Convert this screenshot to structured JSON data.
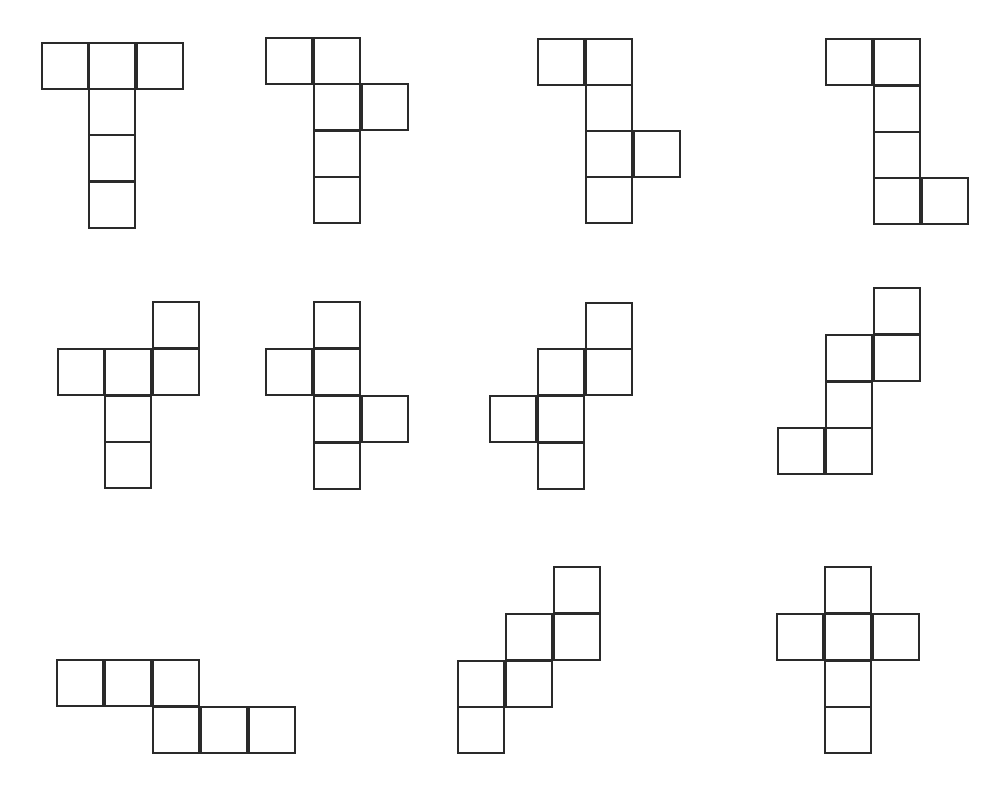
{
  "style": {
    "stroke": "#2a2a2a",
    "fill": "#ffffff",
    "cell_size": 48
  },
  "nets": [
    {
      "id": 1,
      "cells": [
        [
          41,
          42
        ],
        [
          88,
          42
        ],
        [
          136,
          42
        ],
        [
          88,
          88
        ],
        [
          88,
          134
        ],
        [
          88,
          181
        ]
      ]
    },
    {
      "id": 2,
      "cells": [
        [
          265,
          37
        ],
        [
          313,
          37
        ],
        [
          313,
          83
        ],
        [
          361,
          83
        ],
        [
          313,
          130
        ],
        [
          313,
          176
        ]
      ]
    },
    {
      "id": 3,
      "cells": [
        [
          537,
          38
        ],
        [
          585,
          38
        ],
        [
          585,
          84
        ],
        [
          585,
          130
        ],
        [
          633,
          130
        ],
        [
          585,
          176
        ]
      ]
    },
    {
      "id": 4,
      "cells": [
        [
          825,
          38
        ],
        [
          873,
          38
        ],
        [
          873,
          85
        ],
        [
          873,
          131
        ],
        [
          873,
          177
        ],
        [
          921,
          177
        ]
      ]
    },
    {
      "id": 5,
      "cells": [
        [
          152,
          301
        ],
        [
          57,
          348
        ],
        [
          104,
          348
        ],
        [
          152,
          348
        ],
        [
          104,
          395
        ],
        [
          104,
          441
        ]
      ]
    },
    {
      "id": 6,
      "cells": [
        [
          313,
          301
        ],
        [
          265,
          348
        ],
        [
          313,
          348
        ],
        [
          313,
          395
        ],
        [
          361,
          395
        ],
        [
          313,
          442
        ]
      ]
    },
    {
      "id": 7,
      "cells": [
        [
          585,
          302
        ],
        [
          537,
          348
        ],
        [
          585,
          348
        ],
        [
          489,
          395
        ],
        [
          537,
          395
        ],
        [
          537,
          442
        ]
      ]
    },
    {
      "id": 8,
      "cells": [
        [
          873,
          287
        ],
        [
          825,
          334
        ],
        [
          873,
          334
        ],
        [
          825,
          381
        ],
        [
          777,
          427
        ],
        [
          825,
          427
        ]
      ]
    },
    {
      "id": 9,
      "cells": [
        [
          56,
          659
        ],
        [
          104,
          659
        ],
        [
          152,
          659
        ],
        [
          152,
          706
        ],
        [
          200,
          706
        ],
        [
          248,
          706
        ]
      ]
    },
    {
      "id": 10,
      "cells": [
        [
          553,
          566
        ],
        [
          505,
          613
        ],
        [
          553,
          613
        ],
        [
          457,
          660
        ],
        [
          505,
          660
        ],
        [
          457,
          706
        ]
      ]
    },
    {
      "id": 11,
      "cells": [
        [
          824,
          566
        ],
        [
          776,
          613
        ],
        [
          824,
          613
        ],
        [
          872,
          613
        ],
        [
          824,
          660
        ],
        [
          824,
          706
        ]
      ]
    }
  ]
}
